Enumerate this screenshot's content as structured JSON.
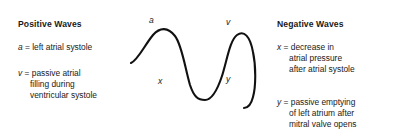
{
  "figure": {
    "type": "annotated-waveform-diagram",
    "wave_labels": [
      {
        "id": "a",
        "text": "a"
      },
      {
        "id": "v",
        "text": "v"
      },
      {
        "id": "x",
        "text": "x"
      },
      {
        "id": "y",
        "text": "y"
      }
    ]
  },
  "positive": {
    "heading": "Positive Waves",
    "entries": [
      {
        "symbol": "a",
        "equals": " = ",
        "definition": "left atrial systole",
        "lines": [
          "left atrial systole"
        ]
      },
      {
        "symbol": "v",
        "equals": " = ",
        "definition": "passive atrial filling during ventricular systole",
        "lines": [
          "passive atrial",
          "filling during",
          "ventricular systole"
        ]
      }
    ]
  },
  "negative": {
    "heading": "Negative Waves",
    "entries": [
      {
        "symbol": "x",
        "equals": " = ",
        "definition": "decrease in atrial pressure after atrial systole",
        "lines": [
          "decrease in",
          "atrial pressure",
          "after atrial systole"
        ]
      },
      {
        "symbol": "y",
        "equals": " = ",
        "definition": "passive emptying of left atrium after mitral valve opens",
        "lines": [
          "passive emptying",
          "of left atrium after",
          "mitral valve opens"
        ]
      }
    ]
  },
  "colors": {
    "background": "#ffffff",
    "text": "#1a1a1a",
    "curve": "#111111"
  }
}
